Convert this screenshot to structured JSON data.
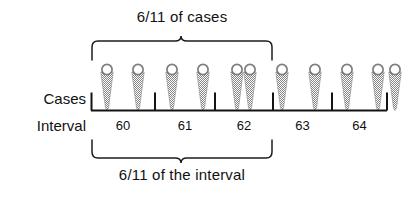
{
  "figure": {
    "caption_top": "6/11 of cases",
    "caption_bottom": "6/11 of the interval",
    "row_labels": {
      "cases": "Cases",
      "interval": "Interval"
    }
  },
  "chart_data": {
    "type": "scatter",
    "title": "6/11 of cases",
    "subtitle": "6/11 of the interval",
    "xlabel": "Interval",
    "ylabel": "Cases",
    "categories": [
      "60",
      "61",
      "62",
      "63",
      "64"
    ],
    "tick_labels": [
      "60",
      "61",
      "62",
      "63",
      "64"
    ],
    "interval_boundaries": [
      91,
      155,
      215,
      273,
      332,
      387
    ],
    "interval_counts": [
      2,
      2,
      2,
      2,
      3
    ],
    "case_count_total": 11,
    "case_positions": [
      107,
      138,
      172,
      203,
      237,
      250,
      282,
      315,
      347,
      378,
      395
    ],
    "cases_marker": "pin-marker",
    "annotations": [
      {
        "name": "cases-brace",
        "text": "6/11 of cases",
        "span_start": 91,
        "span_end": 273,
        "position": "top",
        "covers_cases": 6,
        "covers_total": 11
      },
      {
        "name": "interval-brace",
        "text": "6/11 of the interval",
        "span_start": 91,
        "span_end": 273,
        "position": "bottom",
        "covers_intervals": 3,
        "covers_total_intervals": 5
      }
    ],
    "grid": false,
    "legend": "none",
    "colors": {
      "marker_fill": "#8c8c8c",
      "marker_outline": "#6e6e6e",
      "axis": "#141414",
      "text": "#111111",
      "background": "#ffffff"
    }
  }
}
